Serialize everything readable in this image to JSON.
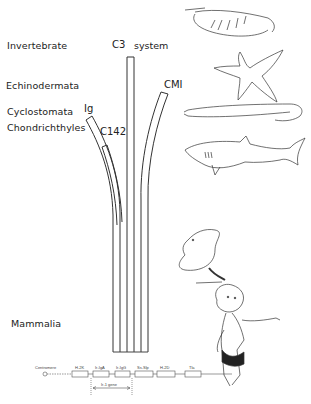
{
  "taxa": [
    {
      "id": "invertebrate",
      "label": "Invertebrate",
      "x": 7,
      "y": 40
    },
    {
      "id": "echinodermata",
      "label": "Echinodermata",
      "x": 6,
      "y": 80
    },
    {
      "id": "cyclostomata",
      "label": "Cyclostomata",
      "x": 7,
      "y": 106
    },
    {
      "id": "chondrichthyles",
      "label": "Chondrichthyles",
      "x": 7,
      "y": 122
    },
    {
      "id": "mammalia",
      "label": "Mammalia",
      "x": 11,
      "y": 318
    }
  ],
  "tubes": [
    {
      "id": "c3",
      "label": "C3",
      "x": 112,
      "y": 40
    },
    {
      "id": "c3-system",
      "label": "system",
      "x": 133,
      "y": 40
    },
    {
      "id": "cmi",
      "label": "CMI",
      "x": 165,
      "y": 80
    },
    {
      "id": "ig",
      "label": "Ig",
      "x": 84,
      "y": 104
    },
    {
      "id": "c142",
      "label": "C142",
      "x": 101,
      "y": 127
    }
  ],
  "gene_map": {
    "centromere": "Centromere",
    "loci": [
      "H-2K",
      "Ir-IgA",
      "Ir-IgG",
      "Ss-Slp",
      "H-2D",
      "Tla"
    ],
    "region_label": "Ir-1 gene"
  },
  "illustrations": [
    "shrimp",
    "starfish",
    "lamprey",
    "shark",
    "mouse",
    "child"
  ]
}
